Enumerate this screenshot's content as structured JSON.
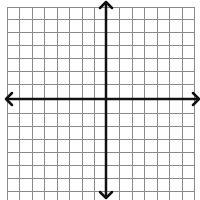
{
  "diagram": {
    "type": "coordinate-plane",
    "title": "",
    "background": "#ffffff",
    "grid": {
      "color": "#8a8a8a",
      "line_width": 1,
      "vertical_lines_x": [
        7,
        19,
        32,
        44,
        57,
        69,
        82,
        94,
        119,
        132,
        144,
        157,
        169,
        182,
        194
      ],
      "horizontal_lines_y": [
        7,
        19,
        32,
        45,
        58,
        71,
        84,
        113,
        126,
        139,
        152,
        165,
        178,
        191
      ],
      "top": 7,
      "bottom": 200,
      "left": 7,
      "right": 194
    },
    "axes": {
      "color": "#111111",
      "line_width": 2.5,
      "x_axis": {
        "y": 99,
        "from_x": 6,
        "to_x": 200,
        "arrows": [
          "left",
          "right"
        ]
      },
      "y_axis": {
        "x": 106,
        "from_y": 2,
        "to_y": 198,
        "arrows": [
          "up",
          "down"
        ]
      }
    },
    "labels": []
  }
}
